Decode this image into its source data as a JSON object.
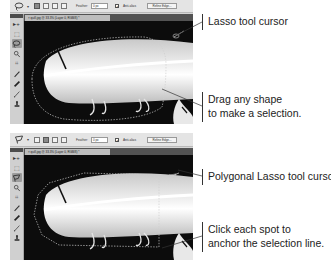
{
  "panels": [
    {
      "tool": "Lasso",
      "options_bar": {
        "tool_preset_icon": "lasso-icon",
        "selection_modes": [
          "new-selection",
          "add-to-selection",
          "subtract-from-selection",
          "intersect-with-selection"
        ],
        "active_mode_index": 0,
        "feather_label": "Feather:",
        "feather_value": "0 px",
        "anti_alias_label": "Anti-alias",
        "anti_alias_checked": "✓",
        "refine_edge_label": "Refine Edge..."
      },
      "document_tab": "× quill.jpg @ 33.3% (Layer 0, RGB/8) *",
      "tools": [
        "move-icon",
        "marquee-icon",
        "lasso-icon",
        "quick-selection-icon",
        "crop-icon",
        "eyedropper-icon",
        "healing-brush-icon",
        "brush-icon",
        "stamp-icon"
      ],
      "active_tool_index": 2,
      "callouts": [
        {
          "lines": [
            "Lasso tool cursor"
          ]
        },
        {
          "lines": [
            "Drag any shape",
            "to make a selection."
          ]
        }
      ]
    },
    {
      "tool": "Polygonal Lasso",
      "options_bar": {
        "tool_preset_icon": "polygonal-lasso-icon",
        "selection_modes": [
          "new-selection",
          "add-to-selection",
          "subtract-from-selection",
          "intersect-with-selection"
        ],
        "active_mode_index": 1,
        "feather_label": "Feather:",
        "feather_value": "0 px",
        "anti_alias_label": "Anti-alias",
        "anti_alias_checked": "✓",
        "refine_edge_label": "Refine Edge..."
      },
      "document_tab": "× quill.jpg @ 33.3% (Layer 0, RGB/8) *",
      "tools": [
        "move-icon",
        "marquee-icon",
        "polygonal-lasso-icon",
        "quick-selection-icon",
        "crop-icon",
        "eyedropper-icon",
        "healing-brush-icon",
        "brush-icon",
        "stamp-icon"
      ],
      "active_tool_index": 2,
      "callouts": [
        {
          "lines": [
            "Polygonal Lasso tool cursor"
          ]
        },
        {
          "lines": [
            "Click each spot to",
            "anchor the selection line."
          ]
        }
      ]
    }
  ],
  "glyphs": {
    "move": "▸+",
    "marquee": "⬚",
    "lasso": "ᑭ",
    "quick_selection": "🔍",
    "crop": "⌗",
    "eyedropper": "⁄",
    "healing": "✎",
    "brush": "∕",
    "stamp": "▲",
    "caret": "▾"
  }
}
